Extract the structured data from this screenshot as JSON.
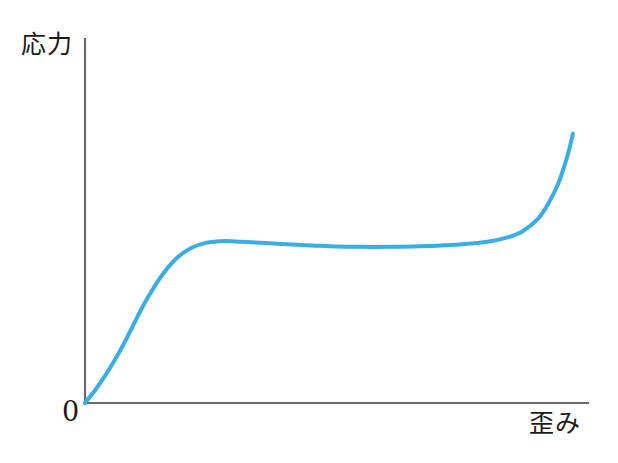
{
  "figure": {
    "background_color": "#ffffff",
    "axis_color": "#6a6a6a",
    "curve_color": "#39ade4",
    "y_axis_label": "応力",
    "x_axis_label": "歪み",
    "origin_label": "0"
  },
  "chart_data": {
    "type": "line",
    "title": "",
    "xlabel": "歪み",
    "ylabel": "応力",
    "grid": false,
    "legend": null,
    "axis_arrows": false,
    "tick_labels": {
      "x": [],
      "y": [],
      "origin": "0"
    },
    "xlim": [
      0,
      1
    ],
    "ylim": [
      0,
      1
    ],
    "series": [
      {
        "name": "応力-歪み曲線",
        "color": "#39ade4",
        "linewidth": 4,
        "x": [
          0.0,
          0.02,
          0.04,
          0.06,
          0.08,
          0.1,
          0.12,
          0.15,
          0.18,
          0.21,
          0.24,
          0.28,
          0.31,
          0.35,
          0.4,
          0.45,
          0.5,
          0.55,
          0.6,
          0.65,
          0.7,
          0.75,
          0.8,
          0.84,
          0.87,
          0.9,
          0.92,
          0.94,
          0.955,
          0.965,
          0.97
        ],
        "y": [
          0.0,
          0.035,
          0.075,
          0.12,
          0.17,
          0.225,
          0.278,
          0.345,
          0.395,
          0.425,
          0.44,
          0.445,
          0.443,
          0.44,
          0.436,
          0.433,
          0.43,
          0.429,
          0.429,
          0.43,
          0.432,
          0.436,
          0.443,
          0.455,
          0.472,
          0.505,
          0.545,
          0.6,
          0.66,
          0.71,
          0.74
        ]
      }
    ],
    "annotations": [
      {
        "text": "応力",
        "role": "y-axis-title",
        "position": "top-left-of-axis"
      },
      {
        "text": "歪み",
        "role": "x-axis-title",
        "position": "right-below-axis"
      },
      {
        "text": "0",
        "role": "origin-marker",
        "position": "below-left-of-origin"
      }
    ],
    "description_points": {
      "origin_px": [
        85,
        403
      ],
      "y_axis_top_px": [
        85,
        39
      ],
      "x_axis_right_px": [
        588,
        403
      ],
      "yield_peak_px": [
        240,
        280
      ],
      "plateau_mid_px": [
        400,
        286
      ],
      "curve_end_px": [
        568,
        177
      ]
    }
  }
}
